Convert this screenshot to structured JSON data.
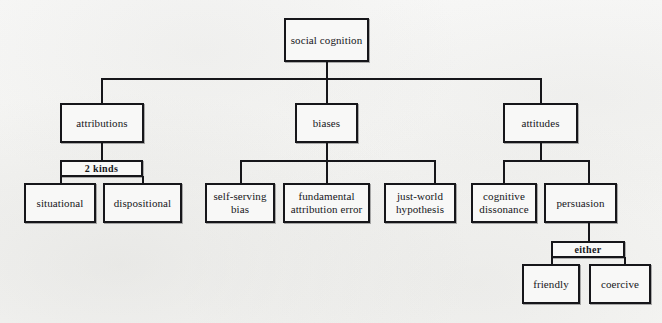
{
  "diagram": {
    "title": "social cognition",
    "type": "hierarchy-tree",
    "background_color": "#f6f6f5",
    "line_color": "#16161a",
    "box_fill_color": "#f8f8f7",
    "nodes": {
      "root": {
        "label": "social cognition",
        "level": 0,
        "kind": "concept"
      },
      "attributions": {
        "label": "attributions",
        "level": 1,
        "kind": "concept"
      },
      "biases": {
        "label": "biases",
        "level": 1,
        "kind": "concept"
      },
      "attitudes": {
        "label": "attitudes",
        "level": 1,
        "kind": "concept"
      },
      "two_kinds": {
        "label": "2 kinds",
        "level": 2,
        "kind": "connector-label"
      },
      "situational": {
        "label": "situational",
        "level": 3,
        "kind": "concept"
      },
      "dispositional": {
        "label": "dispositional",
        "level": 3,
        "kind": "concept"
      },
      "self_serving_bias": {
        "label": "self-serving\nbias",
        "level": 2,
        "kind": "concept"
      },
      "fundamental_attribution_error": {
        "label": "fundamental\nattribution error",
        "level": 2,
        "kind": "concept"
      },
      "just_world_hypothesis": {
        "label": "just-world\nhypothesis",
        "level": 2,
        "kind": "concept"
      },
      "cognitive_dissonance": {
        "label": "cognitive\ndissonance",
        "level": 2,
        "kind": "concept"
      },
      "persuasion": {
        "label": "persuasion",
        "level": 2,
        "kind": "concept"
      },
      "either": {
        "label": "either",
        "level": 3,
        "kind": "connector-label"
      },
      "friendly": {
        "label": "friendly",
        "level": 4,
        "kind": "concept"
      },
      "coercive": {
        "label": "coercive",
        "level": 4,
        "kind": "concept"
      }
    },
    "edges": [
      {
        "from": "root",
        "to": "attributions"
      },
      {
        "from": "root",
        "to": "biases"
      },
      {
        "from": "root",
        "to": "attitudes"
      },
      {
        "from": "attributions",
        "to": "two_kinds"
      },
      {
        "from": "two_kinds",
        "to": "situational"
      },
      {
        "from": "two_kinds",
        "to": "dispositional"
      },
      {
        "from": "biases",
        "to": "self_serving_bias"
      },
      {
        "from": "biases",
        "to": "fundamental_attribution_error"
      },
      {
        "from": "biases",
        "to": "just_world_hypothesis"
      },
      {
        "from": "attitudes",
        "to": "cognitive_dissonance"
      },
      {
        "from": "attitudes",
        "to": "persuasion"
      },
      {
        "from": "persuasion",
        "to": "either"
      },
      {
        "from": "either",
        "to": "friendly"
      },
      {
        "from": "either",
        "to": "coercive"
      }
    ]
  }
}
